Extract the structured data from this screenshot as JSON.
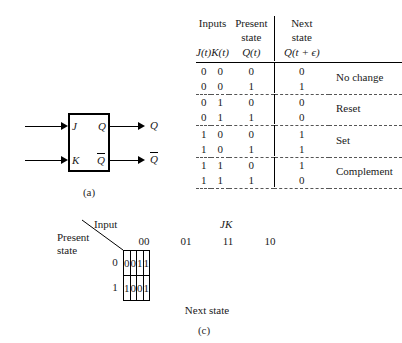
{
  "figure": {
    "cropped_top_line": "",
    "captions": {
      "a": "(a)",
      "b": "(b)",
      "c": "(c)"
    }
  },
  "panel_a": {
    "name": "jk-flip-flop-block",
    "inputs": [
      {
        "label": "J"
      },
      {
        "label": "K"
      }
    ],
    "outputs": [
      {
        "label": "Q",
        "overbar": false
      },
      {
        "label": "Q",
        "overbar": true
      }
    ],
    "external_outputs": [
      {
        "label": "Q",
        "overbar": false
      },
      {
        "label": "Q",
        "overbar": true
      }
    ]
  },
  "panel_b": {
    "name": "jk-truth-table",
    "header_groups": {
      "inputs": "Inputs",
      "present_state": "Present\nstate",
      "present_state_line1": "Present",
      "present_state_line2": "state",
      "next_state_line1": "Next",
      "next_state_line2": "state"
    },
    "columns": [
      "J(t)",
      "K(t)",
      "Q(t)",
      "Q(t + ϵ)"
    ],
    "groups": [
      {
        "note": "No change",
        "rows": [
          {
            "j": "0",
            "k": "0",
            "q": "0",
            "nq": "0"
          },
          {
            "j": "0",
            "k": "0",
            "q": "1",
            "nq": "1"
          }
        ]
      },
      {
        "note": "Reset",
        "rows": [
          {
            "j": "0",
            "k": "1",
            "q": "0",
            "nq": "0"
          },
          {
            "j": "0",
            "k": "1",
            "q": "1",
            "nq": "0"
          }
        ]
      },
      {
        "note": "Set",
        "rows": [
          {
            "j": "1",
            "k": "0",
            "q": "0",
            "nq": "1"
          },
          {
            "j": "1",
            "k": "0",
            "q": "1",
            "nq": "1"
          }
        ]
      },
      {
        "note": "Complement",
        "rows": [
          {
            "j": "1",
            "k": "1",
            "q": "0",
            "nq": "1"
          },
          {
            "j": "1",
            "k": "1",
            "q": "1",
            "nq": "0"
          }
        ]
      }
    ]
  },
  "panel_c": {
    "name": "jk-karnaugh-map",
    "corner": {
      "input_label": "Input",
      "present_label_line1": "Present",
      "present_label_line2": "state"
    },
    "jk_label": "JK",
    "column_headers": [
      "00",
      "01",
      "11",
      "10"
    ],
    "row_labels": [
      "0",
      "1"
    ],
    "cells": [
      [
        "0",
        "0",
        "1",
        "1"
      ],
      [
        "1",
        "0",
        "0",
        "1"
      ]
    ],
    "bottom_label": "Next state"
  }
}
